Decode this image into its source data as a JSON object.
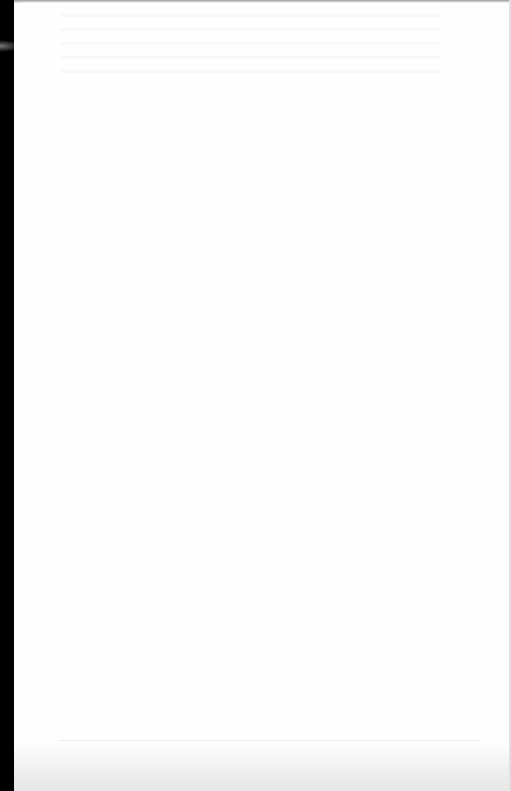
{
  "document": {
    "type": "scanned-page",
    "state": "blank",
    "text": "",
    "colors": {
      "paper": "#fefefe",
      "scan_edge": "#000000",
      "bottom_shadow": "#e6e6e6"
    }
  }
}
